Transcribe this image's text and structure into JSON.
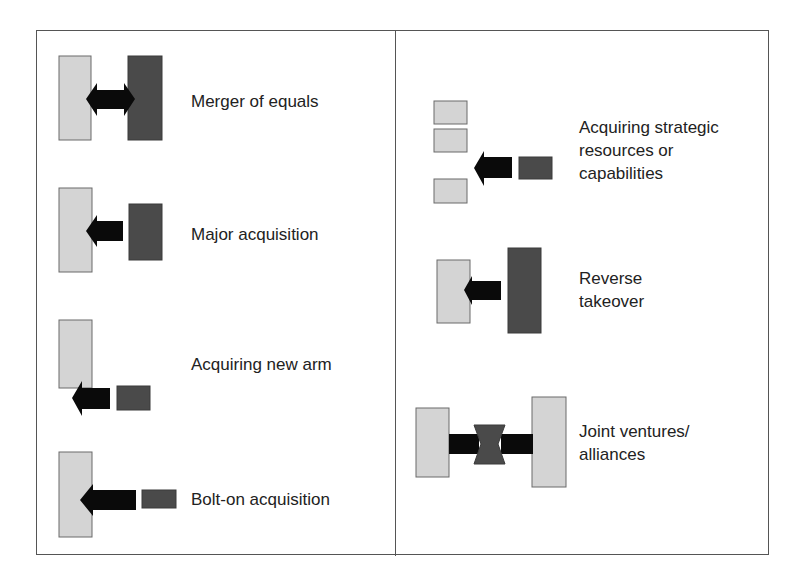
{
  "figure": {
    "left_panel": {
      "items": [
        {
          "label": "Merger of equals",
          "shape": "two-equal-blocks-double-arrow"
        },
        {
          "label": "Major acquisition",
          "shape": "large-block-absorbing-medium-block"
        },
        {
          "label": "Acquiring new arm",
          "shape": "block-acquiring-offset-small-block"
        },
        {
          "label": "Bolt-on acquisition",
          "shape": "block-absorbing-small-block"
        }
      ]
    },
    "right_panel": {
      "items": [
        {
          "label_lines": [
            "Acquiring strategic",
            "resources or",
            "capabilities"
          ],
          "shape": "scattered-blocks-acquiring-small-block"
        },
        {
          "label_lines": [
            "Reverse",
            "takeover"
          ],
          "shape": "small-block-absorbing-larger-block"
        },
        {
          "label_lines": [
            "Joint ventures/",
            "alliances"
          ],
          "shape": "two-blocks-converging-on-shared-entity"
        }
      ]
    },
    "colors": {
      "acquirer": "#d4d4d4",
      "target": "#4a4a4a",
      "arrow": "#0a0a0a",
      "frame": "#555555",
      "text": "#222222"
    }
  }
}
